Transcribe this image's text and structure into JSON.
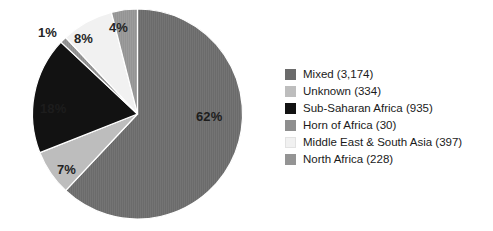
{
  "chart_data": {
    "type": "pie",
    "title": "",
    "subtitle": "",
    "xlabel": "",
    "ylabel": "",
    "grid": false,
    "legend_position": "right",
    "start_angle_deg": 0,
    "direction": "clockwise",
    "total_count": 5098,
    "categories": [
      "Mixed",
      "Unknown",
      "Sub-Saharan Africa",
      "Horn of Africa",
      "Middle East & South Asia",
      "North Africa"
    ],
    "values": [
      62,
      7,
      18,
      1,
      8,
      4
    ],
    "counts": [
      3174,
      334,
      935,
      30,
      397,
      228
    ],
    "slice_labels": [
      "62%",
      "7%",
      "18%",
      "1%",
      "8%",
      "4%"
    ],
    "colors": [
      "#6b6b6b",
      "#bdbdbd",
      "#121212",
      "#8e8e8e",
      "#f1f1f1",
      "#949494"
    ],
    "slices": [
      {
        "name": "Mixed",
        "percent_label": "62%",
        "percent": 62,
        "count": 3174,
        "color": "#6b6b6b",
        "label_tone": "on-dark"
      },
      {
        "name": "Unknown",
        "percent_label": "7%",
        "percent": 7,
        "count": 334,
        "color": "#bdbdbd",
        "label_tone": "on-light"
      },
      {
        "name": "Sub-Saharan Africa",
        "percent_label": "18%",
        "percent": 18,
        "count": 935,
        "color": "#121212",
        "label_tone": "on-dark"
      },
      {
        "name": "Horn of Africa",
        "percent_label": "1%",
        "percent": 1,
        "count": 30,
        "color": "#8e8e8e",
        "label_tone": "outside"
      },
      {
        "name": "Middle East & South Asia",
        "percent_label": "8%",
        "percent": 8,
        "count": 397,
        "color": "#f1f1f1",
        "label_tone": "on-light"
      },
      {
        "name": "North Africa",
        "percent_label": "4%",
        "percent": 4,
        "count": 228,
        "color": "#949494",
        "label_tone": "on-light"
      }
    ]
  },
  "legend": {
    "items": [
      {
        "label": "Mixed (3,174)",
        "color": "#6b6b6b",
        "swatch_name": "legend-swatch-mixed"
      },
      {
        "label": "Unknown (334)",
        "color": "#bdbdbd",
        "swatch_name": "legend-swatch-unknown"
      },
      {
        "label": "Sub-Saharan Africa (935)",
        "color": "#121212",
        "swatch_name": "legend-swatch-sub-saharan-africa"
      },
      {
        "label": "Horn of Africa (30)",
        "color": "#8e8e8e",
        "swatch_name": "legend-swatch-horn-of-africa"
      },
      {
        "label": "Middle East & South Asia (397)",
        "color": "#f1f1f1",
        "swatch_name": "legend-swatch-middle-east-south-asia"
      },
      {
        "label": "North Africa (228)",
        "color": "#949494",
        "swatch_name": "legend-swatch-north-africa"
      }
    ]
  },
  "colors": {
    "background": "#ffffff",
    "text": "#1a1a1a",
    "slice_outline": "#ffffff"
  }
}
